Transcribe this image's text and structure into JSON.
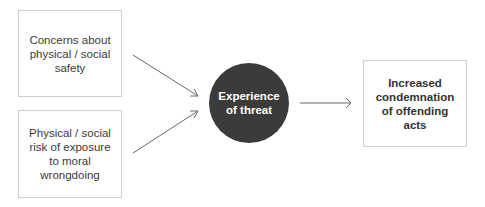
{
  "diagram": {
    "inputs": [
      {
        "id": "box-1",
        "label": "Concerns about physical / social safety"
      },
      {
        "id": "box-2",
        "label": "Physical / social risk of exposure to moral wrongdoing"
      }
    ],
    "central_node": {
      "label": "Experience of threat",
      "color": "#3b3b3b"
    },
    "output": {
      "label": "Increased condemnation of offending acts"
    },
    "edges": [
      {
        "from": "Concerns about physical / social safety",
        "to": "Experience of threat"
      },
      {
        "from": "Physical / social risk of exposure to moral wrongdoing",
        "to": "Experience of threat"
      },
      {
        "from": "Experience of threat",
        "to": "Increased condemnation of offending acts"
      }
    ],
    "colors": {
      "border": "#cfcfcf",
      "text": "#3a3a3a",
      "arrow": "#6a6a6a"
    }
  }
}
